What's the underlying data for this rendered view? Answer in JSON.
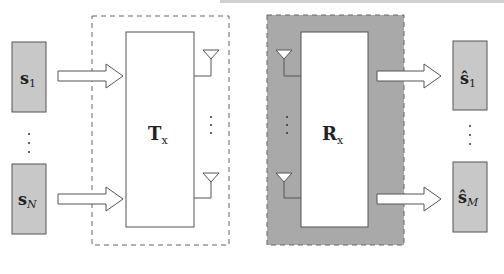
{
  "diagram": {
    "title": "",
    "colors": {
      "source_fill": "#c8c8c8",
      "receiver_region_fill": "#a9a9a9",
      "stroke": "#555555",
      "block_fill": "#ffffff",
      "background": "#ffffff"
    },
    "sources": [
      {
        "symbol": "s",
        "subscript": "1"
      },
      {
        "symbol": "s",
        "subscript": "N"
      }
    ],
    "source_ellipsis": "⋮",
    "transmitter": {
      "symbol": "T",
      "subscript": "x"
    },
    "transmit_antennas_ellipsis": "⋮",
    "receiver": {
      "symbol": "R",
      "subscript": "x"
    },
    "receive_antennas_ellipsis": "⋮",
    "outputs": [
      {
        "symbol": "ŝ",
        "subscript": "1"
      },
      {
        "symbol": "ŝ",
        "subscript": "M"
      }
    ],
    "output_ellipsis": "⋮"
  }
}
